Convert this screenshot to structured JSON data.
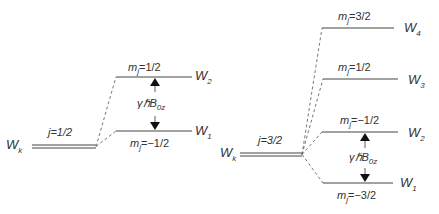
{
  "left": {
    "base": "W",
    "base_sub": "k",
    "j_label": "j=1/2",
    "upper_m": "m",
    "upper_m_sub": "j",
    "upper_m_val": "=1/2",
    "lower_m": "m",
    "lower_m_sub": "j",
    "lower_m_val": "=−1/2",
    "upper_level": "W",
    "upper_level_sub": "2",
    "lower_level": "W",
    "lower_level_sub": "1",
    "gap_label": "γℏB",
    "gap_sub": "0z"
  },
  "right": {
    "base": "W",
    "base_sub": "k",
    "j_label": "j=3/2",
    "levels": [
      {
        "m_val": "=3/2",
        "level": "W",
        "sub": "4"
      },
      {
        "m_val": "=1/2",
        "level": "W",
        "sub": "3"
      },
      {
        "m_val": "=−1/2",
        "level": "W",
        "sub": "2"
      },
      {
        "m_val": "=−3/2",
        "level": "W",
        "sub": "1"
      }
    ],
    "m": "m",
    "m_sub": "j",
    "gap_label": "γℏB",
    "gap_sub": "0z"
  }
}
